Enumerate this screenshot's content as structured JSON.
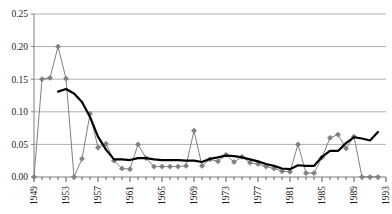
{
  "chart_data": {
    "type": "line",
    "title": "",
    "subtitle": "",
    "xlabel": "",
    "ylabel": "",
    "xlim": [
      1949,
      1993
    ],
    "ylim": [
      0.0,
      0.25
    ],
    "grid": true,
    "legend_position": "none",
    "y_ticks": [
      0.0,
      0.05,
      0.1,
      0.15,
      0.2,
      0.25
    ],
    "y_tick_labels": [
      "0.00",
      "0.05",
      "0.10",
      "0.15",
      "0.20",
      "0.25"
    ],
    "x_ticks": [
      1949,
      1953,
      1957,
      1961,
      1965,
      1969,
      1973,
      1977,
      1981,
      1985,
      1989,
      1993
    ],
    "x_tick_labels": [
      "1949",
      "1953",
      "1957",
      "1961",
      "1965",
      "1969",
      "1973",
      "1977",
      "1981",
      "1985",
      "1989",
      "1993"
    ],
    "x_minor_ticks_every": 1,
    "x": [
      1949,
      1950,
      1951,
      1952,
      1953,
      1954,
      1955,
      1956,
      1957,
      1958,
      1959,
      1960,
      1961,
      1962,
      1963,
      1964,
      1965,
      1966,
      1967,
      1968,
      1969,
      1970,
      1971,
      1972,
      1973,
      1974,
      1975,
      1976,
      1977,
      1978,
      1979,
      1980,
      1981,
      1982,
      1983,
      1984,
      1985,
      1986,
      1987,
      1988,
      1989,
      1990,
      1991,
      1992
    ],
    "series": [
      {
        "name": "annual-series",
        "style": "line-with-diamond-markers",
        "color": "#808080",
        "marker": "diamond",
        "values": [
          0.0,
          0.15,
          0.152,
          0.2,
          0.151,
          0.0,
          0.028,
          0.097,
          0.045,
          0.051,
          0.025,
          0.013,
          0.012,
          0.05,
          0.029,
          0.016,
          0.016,
          0.016,
          0.016,
          0.017,
          0.071,
          0.017,
          0.027,
          0.024,
          0.034,
          0.023,
          0.031,
          0.022,
          0.02,
          0.016,
          0.013,
          0.009,
          0.008,
          0.05,
          0.006,
          0.006,
          0.03,
          0.06,
          0.065,
          0.044,
          0.062,
          0.0,
          0.0,
          0.0
        ]
      },
      {
        "name": "smoothed-trend",
        "style": "thick-line",
        "color": "#000000",
        "marker": "none",
        "values": [
          null,
          null,
          null,
          0.131,
          0.135,
          0.128,
          0.115,
          0.092,
          0.062,
          0.042,
          0.027,
          0.027,
          0.026,
          0.029,
          0.029,
          0.027,
          0.026,
          0.026,
          0.026,
          0.025,
          0.025,
          0.023,
          0.028,
          0.03,
          0.033,
          0.032,
          0.03,
          0.027,
          0.024,
          0.02,
          0.017,
          0.013,
          0.012,
          0.018,
          0.017,
          0.017,
          0.031,
          0.04,
          0.04,
          0.052,
          0.061,
          0.059,
          0.056,
          0.069
        ]
      }
    ]
  }
}
